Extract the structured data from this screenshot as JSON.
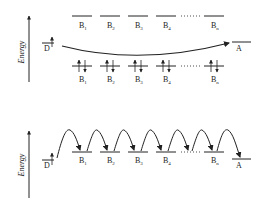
{
  "colors": {
    "ink": "#222222",
    "background": "#ffffff"
  },
  "top_panel": {
    "axis_label": "Energy",
    "donor_label": "D",
    "acceptor_label": "A",
    "bridge_upper": [
      {
        "base": "B",
        "sub": "1"
      },
      {
        "base": "B",
        "sub": "2"
      },
      {
        "base": "B",
        "sub": "3"
      },
      {
        "base": "B",
        "sub": "4"
      },
      {
        "base": "B",
        "sub": "n"
      }
    ],
    "bridge_lower": [
      {
        "base": "B",
        "sub": "1"
      },
      {
        "base": "B",
        "sub": "2"
      },
      {
        "base": "B",
        "sub": "3"
      },
      {
        "base": "B",
        "sub": "4"
      },
      {
        "base": "B",
        "sub": "n"
      }
    ],
    "ellipsis": "......",
    "mechanism": "superexchange"
  },
  "bottom_panel": {
    "axis_label": "Energy",
    "donor_label": "D",
    "acceptor_label": "A",
    "bridge": [
      {
        "base": "B",
        "sub": "1"
      },
      {
        "base": "B",
        "sub": "2"
      },
      {
        "base": "B",
        "sub": "3"
      },
      {
        "base": "B",
        "sub": "4"
      },
      {
        "base": "B",
        "sub": "n"
      }
    ],
    "ellipsis": "......",
    "mechanism": "hopping"
  }
}
